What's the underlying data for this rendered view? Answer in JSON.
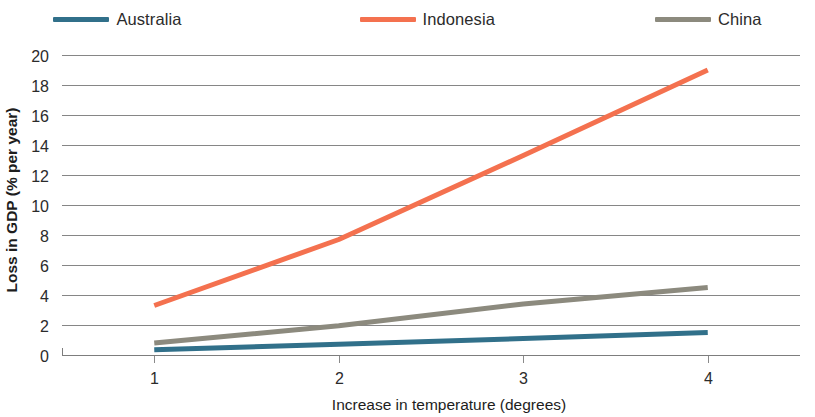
{
  "legend": {
    "position": "top",
    "entries": [
      {
        "label": "Australia",
        "color": "#31708a",
        "swatch_name": "legend-swatch-australia"
      },
      {
        "label": "Indonesia",
        "color": "#f4714f",
        "swatch_name": "legend-swatch-indonesia"
      },
      {
        "label": "China",
        "color": "#8c8a7e",
        "swatch_name": "legend-swatch-china"
      }
    ]
  },
  "axes": {
    "y_title": "Loss in GDP (% per year)",
    "x_title": "Increase in temperature (degrees)",
    "y_ticks": [
      "0",
      "2",
      "4",
      "6",
      "8",
      "10",
      "12",
      "14",
      "16",
      "18",
      "20"
    ],
    "x_ticks": [
      "1",
      "2",
      "3",
      "4"
    ]
  },
  "chart_data": {
    "type": "line",
    "title": "",
    "subtitle": "",
    "xlabel": "Increase in temperature (degrees)",
    "ylabel": "Loss in GDP (% per year)",
    "x": [
      1,
      2,
      3,
      4
    ],
    "xlim": [
      0.5,
      4.5
    ],
    "ylim": [
      0,
      20
    ],
    "ytick_step": 2,
    "grid": "horizontal",
    "legend_position": "top",
    "series": [
      {
        "name": "Australia",
        "color": "#31708a",
        "values": [
          0.35,
          0.72,
          1.1,
          1.5
        ]
      },
      {
        "name": "Indonesia",
        "color": "#f4714f",
        "values": [
          3.3,
          7.7,
          13.3,
          19.0
        ]
      },
      {
        "name": "China",
        "color": "#8c8a7e",
        "values": [
          0.8,
          1.95,
          3.4,
          4.5
        ]
      }
    ]
  }
}
